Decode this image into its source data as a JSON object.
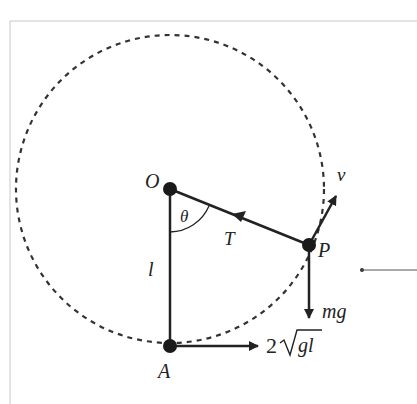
{
  "diagram": {
    "type": "vertical-circle-pendulum",
    "points": {
      "O": {
        "label": "O",
        "x": 170,
        "y": 189
      },
      "P": {
        "label": "P",
        "x": 309,
        "y": 245
      },
      "A": {
        "label": "A",
        "x": 170,
        "y": 346
      }
    },
    "circle": {
      "cx": 170,
      "cy": 189,
      "r": 154,
      "style": "dashed"
    },
    "labels": {
      "pivot": "O",
      "particle": "P",
      "bottom": "A",
      "angle": "θ",
      "tension": "T",
      "velocity": "v",
      "weight": "mg",
      "length": "l",
      "initial_speed_coeff": "2",
      "initial_speed_radicand": "gl"
    },
    "colors": {
      "ink": "#222222",
      "dash": "#333333",
      "frame": "#c8c8c8",
      "background": "#ffffff"
    }
  }
}
